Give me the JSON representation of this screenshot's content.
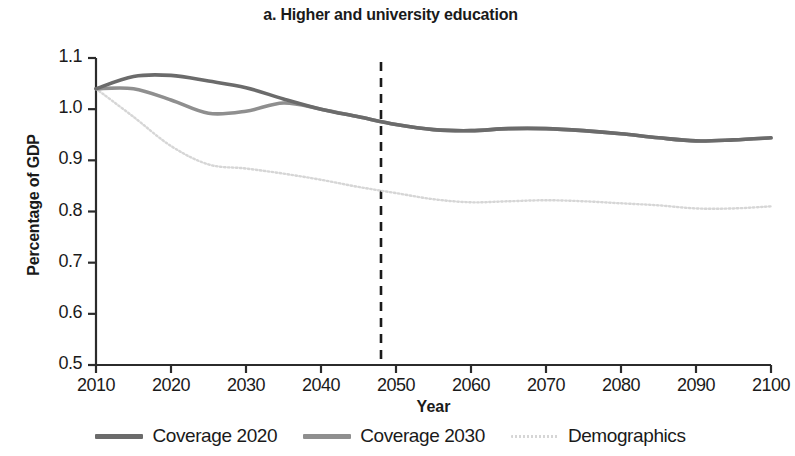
{
  "chart_data": {
    "type": "line",
    "title": "a. Higher and university education",
    "xlabel": "Year",
    "ylabel": "Percentage of GDP",
    "xlim": [
      2010,
      2100
    ],
    "ylim": [
      0.5,
      1.1
    ],
    "xticks": [
      "2010",
      "2020",
      "2030",
      "2040",
      "2050",
      "2060",
      "2070",
      "2080",
      "2090",
      "2100"
    ],
    "yticks": [
      "0.5",
      "0.6",
      "0.7",
      "0.8",
      "0.9",
      "1.0",
      "1.1"
    ],
    "grid": false,
    "legend_position": "bottom",
    "annotations": [
      {
        "type": "vertical-dashed-line",
        "x": 2048,
        "label": ""
      }
    ],
    "x": [
      2010,
      2015,
      2020,
      2025,
      2030,
      2035,
      2040,
      2045,
      2050,
      2055,
      2060,
      2065,
      2070,
      2075,
      2080,
      2085,
      2090,
      2095,
      2100
    ],
    "series": [
      {
        "name": "Coverage 2020",
        "color": "#6b6b6b",
        "style": "solid",
        "values": [
          1.04,
          1.064,
          1.066,
          1.055,
          1.042,
          1.02,
          1.0,
          0.985,
          0.97,
          0.96,
          0.958,
          0.962,
          0.962,
          0.958,
          0.952,
          0.944,
          0.938,
          0.94,
          0.944
        ]
      },
      {
        "name": "Coverage 2030",
        "color": "#8f8f8f",
        "style": "solid",
        "values": [
          1.04,
          1.04,
          1.018,
          0.992,
          0.996,
          1.012,
          1.0,
          0.985,
          0.97,
          0.96,
          0.958,
          0.962,
          0.962,
          0.958,
          0.952,
          0.944,
          0.938,
          0.94,
          0.944
        ]
      },
      {
        "name": "Demographics",
        "color": "#d6d6d6",
        "style": "dotted",
        "values": [
          1.04,
          0.985,
          0.928,
          0.892,
          0.884,
          0.874,
          0.862,
          0.848,
          0.836,
          0.824,
          0.818,
          0.82,
          0.822,
          0.82,
          0.816,
          0.812,
          0.806,
          0.806,
          0.81
        ]
      }
    ]
  },
  "legend": {
    "items": [
      {
        "label": "Coverage 2020",
        "color": "#6b6b6b",
        "style": "solid"
      },
      {
        "label": "Coverage 2030",
        "color": "#8f8f8f",
        "style": "solid"
      },
      {
        "label": "Demographics",
        "color": "#d6d6d6",
        "style": "dotted"
      }
    ]
  }
}
